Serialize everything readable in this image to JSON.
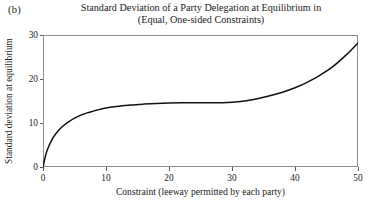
{
  "panel": {
    "label": "(b)"
  },
  "title": {
    "line1": "Standard Deviation of a Party Delegation at Equilibrium in",
    "line2": "(Equal, One-sided Constraints)"
  },
  "chart_data": {
    "type": "line",
    "title": "Standard Deviation of a Party Delegation at Equilibrium in (Equal, One-sided Constraints)",
    "xlabel": "Constraint (leeway permitted by each party)",
    "ylabel": "Standard deviation at equilibrium",
    "xlim": [
      0,
      50
    ],
    "ylim": [
      0,
      30
    ],
    "xticks": [
      0,
      10,
      20,
      30,
      40,
      50
    ],
    "yticks": [
      0,
      10,
      20,
      30
    ],
    "grid": false,
    "legend": null,
    "series": [
      {
        "name": "Standard deviation at equilibrium",
        "color": "#111111",
        "x": [
          0,
          0.5,
          1,
          1.5,
          2,
          3,
          4,
          5,
          6,
          7,
          8,
          9,
          10,
          12,
          14,
          16,
          18,
          20,
          22,
          24,
          26,
          28,
          30,
          32,
          34,
          36,
          38,
          40,
          42,
          44,
          46,
          48,
          49,
          50
        ],
        "y": [
          0,
          3.1,
          5.0,
          6.4,
          7.5,
          9.1,
          10.2,
          11.1,
          11.8,
          12.3,
          12.7,
          13.1,
          13.4,
          13.8,
          14.1,
          14.3,
          14.45,
          14.55,
          14.6,
          14.62,
          14.6,
          14.62,
          14.7,
          15.0,
          15.5,
          16.2,
          17.0,
          18.0,
          19.3,
          20.9,
          22.8,
          25.3,
          26.7,
          28.2
        ]
      }
    ]
  }
}
